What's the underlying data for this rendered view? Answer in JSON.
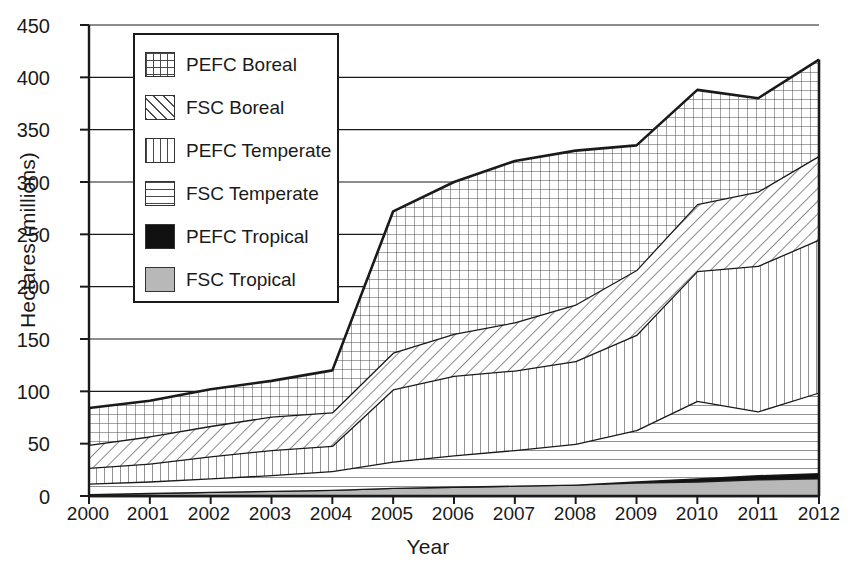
{
  "chart_data": {
    "type": "area",
    "title": "",
    "xlabel": "Year",
    "ylabel": "Hectares (millions)",
    "categories": [
      "2000",
      "2001",
      "2002",
      "2003",
      "2004",
      "2005",
      "2006",
      "2007",
      "2008",
      "2009",
      "2010",
      "2011",
      "2012"
    ],
    "x": [
      2000,
      2001,
      2002,
      2003,
      2004,
      2005,
      2006,
      2007,
      2008,
      2009,
      2010,
      2011,
      2012
    ],
    "xlim": [
      2000,
      2012
    ],
    "ylim": [
      0,
      450
    ],
    "ytick_step": 50,
    "grid": true,
    "stacked": true,
    "legend_position": "upper-left",
    "series": [
      {
        "name": "FSC Tropical",
        "pattern": "solid-gray",
        "values": [
          2,
          3,
          4,
          5,
          6,
          8,
          9,
          10,
          11,
          13,
          14,
          16,
          17
        ]
      },
      {
        "name": "PEFC Tropical",
        "pattern": "solid-black",
        "values": [
          0,
          0,
          0,
          0,
          0,
          0,
          0,
          0,
          0,
          1,
          3,
          4,
          5
        ]
      },
      {
        "name": "FSC Temperate",
        "pattern": "horizontal-lines",
        "values": [
          10,
          11,
          13,
          15,
          18,
          25,
          30,
          34,
          39,
          49,
          74,
          61,
          77
        ]
      },
      {
        "name": "PEFC Temperate",
        "pattern": "vertical-lines",
        "values": [
          15,
          17,
          21,
          24,
          24,
          69,
          76,
          76,
          79,
          91,
          124,
          139,
          146
        ]
      },
      {
        "name": "FSC Boreal",
        "pattern": "diagonal-hatch",
        "values": [
          22,
          26,
          29,
          32,
          32,
          35,
          40,
          46,
          54,
          62,
          64,
          71,
          80
        ]
      },
      {
        "name": "PEFC Boreal",
        "pattern": "grid-crosshatch",
        "values": [
          35,
          34,
          35,
          34,
          40,
          135,
          145,
          154,
          147,
          119,
          109,
          89,
          92
        ]
      }
    ],
    "cumulative_boundaries": {
      "note": "Top edge of each stacked band, millions of hectares",
      "fsc_tropical": [
        2,
        3,
        4,
        5,
        6,
        8,
        9,
        10,
        11,
        13,
        14,
        16,
        17
      ],
      "pefc_tropical": [
        2,
        3,
        4,
        5,
        6,
        8,
        9,
        10,
        11,
        14,
        17,
        20,
        22
      ],
      "fsc_temperate": [
        12,
        14,
        17,
        20,
        24,
        33,
        39,
        44,
        50,
        63,
        91,
        81,
        99
      ],
      "pefc_temperate": [
        27,
        31,
        38,
        44,
        48,
        102,
        115,
        120,
        129,
        154,
        215,
        220,
        245
      ],
      "fsc_boreal": [
        49,
        57,
        67,
        76,
        80,
        137,
        155,
        166,
        183,
        216,
        279,
        291,
        325
      ],
      "pefc_boreal": [
        57,
        62,
        71,
        83,
        100,
        252,
        281,
        289,
        300,
        338,
        379,
        391,
        417
      ]
    }
  },
  "axes": {
    "y_ticks": [
      "450",
      "400",
      "350",
      "300",
      "250",
      "200",
      "150",
      "100",
      "50",
      "0"
    ],
    "x_ticks": [
      "2000",
      "2001",
      "2002",
      "2003",
      "2004",
      "2005",
      "2006",
      "2007",
      "2008",
      "2009",
      "2010",
      "2011",
      "2012"
    ],
    "y_title": "Hectares (millions)",
    "x_title": "Year"
  },
  "legend": {
    "items": [
      {
        "label": "PEFC Boreal",
        "swatch": "grid-crosshatch-swatch"
      },
      {
        "label": "FSC Boreal",
        "swatch": "diagonal-hatch-swatch"
      },
      {
        "label": "PEFC Temperate",
        "swatch": "vertical-lines-swatch"
      },
      {
        "label": "FSC Temperate",
        "swatch": "horizontal-lines-swatch"
      },
      {
        "label": "PEFC Tropical",
        "swatch": "solid-black-swatch"
      },
      {
        "label": "FSC Tropical",
        "swatch": "solid-gray-swatch"
      }
    ]
  },
  "colors": {
    "line": "#1a1a1a",
    "grid": "#1a1a1a",
    "black_fill": "#111111",
    "gray_fill": "#b8b8b8",
    "pattern_stroke": "#4a4a4a",
    "background": "#ffffff"
  }
}
